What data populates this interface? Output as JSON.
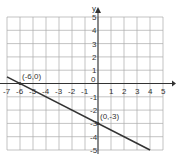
{
  "chart_data": {
    "type": "line",
    "title": "",
    "xlabel": "",
    "ylabel": "y",
    "xlim": [
      -7,
      5
    ],
    "ylim": [
      -5,
      5
    ],
    "grid": true,
    "x_ticks": [
      -7,
      -6,
      -5,
      -4,
      -3,
      -2,
      -1,
      0,
      1,
      2,
      3,
      4,
      5
    ],
    "y_ticks": [
      5,
      4,
      3,
      2,
      1,
      -1,
      -2,
      -3,
      -4,
      -5
    ],
    "series": [
      {
        "name": "line",
        "x": [
          -7,
          4
        ],
        "y": [
          0.5,
          -5
        ]
      }
    ],
    "points": [
      {
        "label": "(-6,0)",
        "x": -6,
        "y": 0
      },
      {
        "label": "(0,-3)",
        "x": 0,
        "y": -3
      }
    ]
  },
  "labels": {
    "y_axis": "y",
    "point1": "(-6,0)",
    "point2": "(0,-3)"
  }
}
